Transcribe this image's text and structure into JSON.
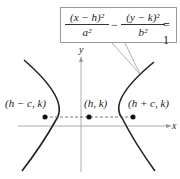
{
  "equation": {
    "term1_num": "(x − h)²",
    "term1_den": "a²",
    "minus": "−",
    "term2_num": "(y − k)²",
    "term2_den": "b²",
    "rhs": "= 1"
  },
  "axes": {
    "x_label": "x",
    "y_label": "y"
  },
  "points": {
    "left_focus": "(h − c, k)",
    "center": "(h, k)",
    "right_focus": "(h + c, k)"
  },
  "colors": {
    "curve": "#222222",
    "axis": "#888888",
    "callout_border": "#9a9a9a"
  }
}
